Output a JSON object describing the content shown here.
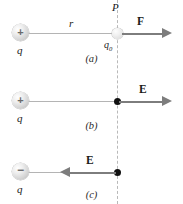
{
  "figure": {
    "type": "physics-vector-diagram",
    "panels": [
      {
        "id": "a",
        "caption": "(a)",
        "source_charge": {
          "sign": "+",
          "symbol": "+",
          "label": "q"
        },
        "distance_label": "r",
        "point_label": "P",
        "test_charge_label": "q0",
        "test_charge_label_base": "q",
        "test_charge_label_sub": "0",
        "vector": {
          "label": "F",
          "direction": "right"
        }
      },
      {
        "id": "b",
        "caption": "(b)",
        "source_charge": {
          "sign": "+",
          "symbol": "+",
          "label": "q"
        },
        "point_marker": "filled-dot",
        "vector": {
          "label": "E",
          "direction": "right"
        }
      },
      {
        "id": "c",
        "caption": "(c)",
        "source_charge": {
          "sign": "-",
          "symbol": "−",
          "label": "q"
        },
        "point_marker": "filled-dot",
        "vector": {
          "label": "E",
          "direction": "left"
        }
      }
    ]
  },
  "colors": {
    "background": "#ffffff",
    "arrow": "#7d7d7d",
    "connector": "#b4b4b4",
    "dashed_line": "#b9b9b9",
    "point_dot": "#111111",
    "text": "#1a1a1a"
  }
}
